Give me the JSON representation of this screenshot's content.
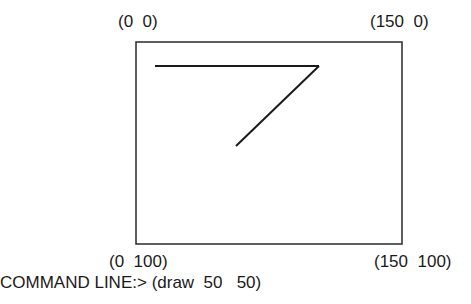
{
  "canvas": {
    "corner_labels": {
      "top_left": "(0  0)",
      "top_right": "(150  0)",
      "bottom_left": "(0  100)",
      "bottom_right": "(150  100)"
    },
    "frame": {
      "x": 136,
      "y": 42,
      "width": 266,
      "height": 202,
      "stroke": "#2a2a2a"
    },
    "lines": [
      {
        "x1": 155,
        "y1": 66,
        "x2": 319,
        "y2": 66
      },
      {
        "x1": 319,
        "y1": 66,
        "x2": 236,
        "y2": 146
      }
    ],
    "line_color": "#1a1a1a"
  },
  "command_line": {
    "prompt": "COMMAND LINE:>",
    "value": "(draw  50   50)"
  }
}
